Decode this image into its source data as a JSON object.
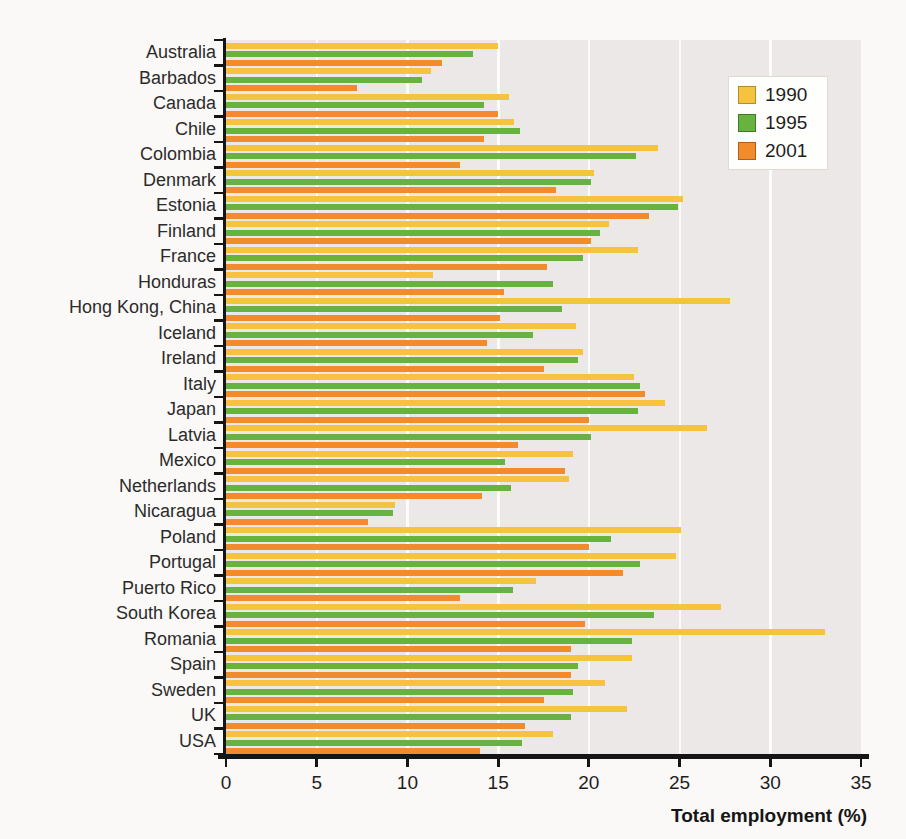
{
  "page": {
    "background_color": "#FBF9F7",
    "plot_background_color": "#ECE8E7"
  },
  "chart_data": {
    "type": "bar",
    "orientation": "horizontal",
    "title": "",
    "xlabel": "Total employment (%)",
    "ylabel": "",
    "xlim": [
      0,
      35
    ],
    "xticks": [
      0,
      5,
      10,
      15,
      20,
      25,
      30,
      35
    ],
    "grid": "faint white vertical gridlines every 5 units",
    "legend_position": "top-right inside plot, white box",
    "categories": [
      "Australia",
      "Barbados",
      "Canada",
      "Chile",
      "Colombia",
      "Denmark",
      "Estonia",
      "Finland",
      "France",
      "Honduras",
      "Hong Kong, China",
      "Iceland",
      "Ireland",
      "Italy",
      "Japan",
      "Latvia",
      "Mexico",
      "Netherlands",
      "Nicaragua",
      "Poland",
      "Portugal",
      "Puerto Rico",
      "South Korea",
      "Romania",
      "Spain",
      "Sweden",
      "UK",
      "USA"
    ],
    "series": [
      {
        "name": "1990",
        "color": "#F5C33E",
        "swatch_border": "#B08E2F",
        "values": [
          15.0,
          11.3,
          15.6,
          15.9,
          23.8,
          20.3,
          25.2,
          21.1,
          22.7,
          11.4,
          27.8,
          19.3,
          19.7,
          22.5,
          24.2,
          26.5,
          19.1,
          18.9,
          9.3,
          25.1,
          24.8,
          17.1,
          27.3,
          33.0,
          22.4,
          20.9,
          22.1,
          18.0
        ]
      },
      {
        "name": "1995",
        "color": "#68B240",
        "swatch_border": "#3F7A26",
        "values": [
          13.6,
          10.8,
          14.2,
          16.2,
          22.6,
          20.1,
          24.9,
          20.6,
          19.7,
          18.0,
          18.5,
          16.9,
          19.4,
          22.8,
          22.7,
          20.1,
          15.4,
          15.7,
          9.2,
          21.2,
          22.8,
          15.8,
          23.6,
          22.4,
          19.4,
          19.1,
          19.0,
          16.3
        ]
      },
      {
        "name": "2001",
        "color": "#F28B2B",
        "swatch_border": "#B25E14",
        "values": [
          11.9,
          7.2,
          15.0,
          14.2,
          12.9,
          18.2,
          23.3,
          20.1,
          17.7,
          15.3,
          15.1,
          14.4,
          17.5,
          23.1,
          20.0,
          16.1,
          18.7,
          14.1,
          7.8,
          20.0,
          21.9,
          12.9,
          19.8,
          19.0,
          19.0,
          17.5,
          16.5,
          14.0
        ]
      }
    ]
  }
}
